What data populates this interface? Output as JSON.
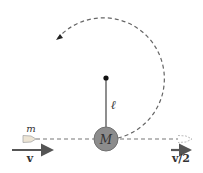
{
  "diagram": {
    "labels": {
      "bullet_mass": "m",
      "pendulum_mass": "M",
      "string_length": "ℓ",
      "initial_velocity": "v",
      "final_velocity": "v/2"
    },
    "colors": {
      "dashed_path": "#555555",
      "ball_fill": "#8a8a8a",
      "ball_stroke": "#6a6a6a",
      "arrow": "#555555",
      "bullet_fill": "#e8e0d0",
      "pivot": "#111111",
      "string": "#444444"
    }
  }
}
